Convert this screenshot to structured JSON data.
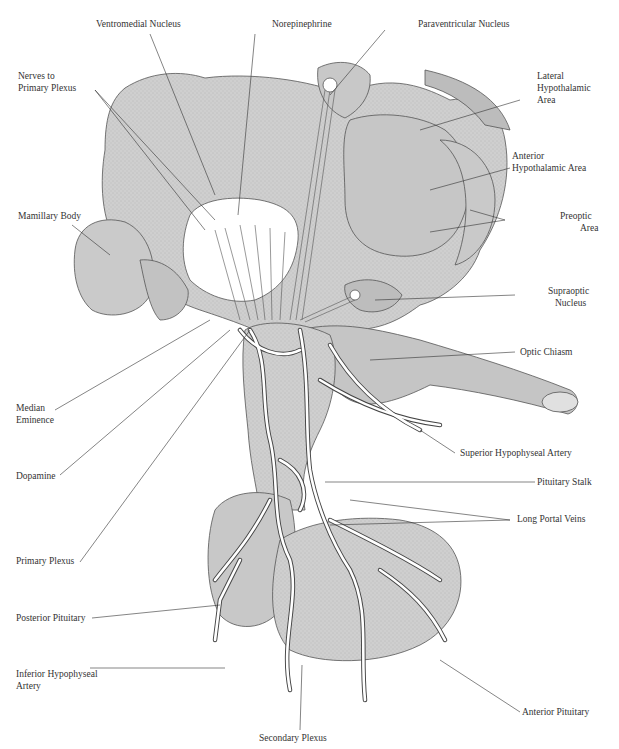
{
  "diagram": {
    "type": "anatomical illustration",
    "labels": {
      "ventromedial_nucleus": "Ventromedial Nucleus",
      "norepinephrine": "Norepinephrine",
      "paraventricular_nucleus": "Paraventricular Nucleus",
      "nerves_to_primary_plexus_1": "Nerves to",
      "nerves_to_primary_plexus_2": "Primary Plexus",
      "lateral_hypothalamic_1": "Lateral",
      "lateral_hypothalamic_2": "Hypothalamic",
      "lateral_hypothalamic_3": "Area",
      "anterior_hypothalamic_1": "Anterior",
      "anterior_hypothalamic_2": "Hypothalamic Area",
      "mamillary_body": "Mamillary Body",
      "preoptic_1": "Preoptic",
      "preoptic_2": "Area",
      "supraoptic_1": "Supraoptic",
      "supraoptic_2": "Nucleus",
      "optic_chiasm": "Optic Chiasm",
      "median_eminence_1": "Median",
      "median_eminence_2": "Eminence",
      "superior_hypophyseal_artery": "Superior Hypophyseal Artery",
      "dopamine": "Dopamine",
      "pituitary_stalk": "Pituitary Stalk",
      "primary_plexus": "Primary Plexus",
      "long_portal_veins": "Long Portal Veins",
      "posterior_pituitary": "Posterior Pituitary",
      "inferior_hypophyseal_1": "Inferior Hypophyseal",
      "inferior_hypophyseal_2": "Artery",
      "anterior_pituitary": "Anterior Pituitary",
      "secondary_plexus": "Secondary Plexus"
    },
    "colors": {
      "tissue_fill": "#cfcfcf",
      "tissue_dark": "#bdbdbd",
      "line": "#444444",
      "vessel_fill": "#ffffff"
    }
  }
}
